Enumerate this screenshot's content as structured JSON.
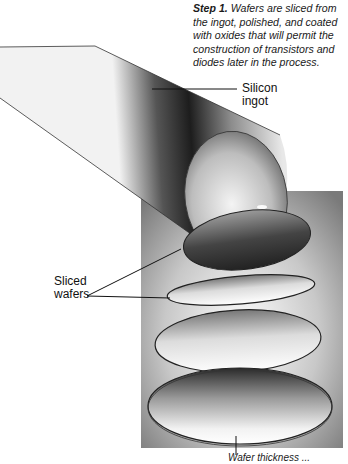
{
  "caption": {
    "step": "Step 1.",
    "text": "Wafers are sliced from the ingot, polished, and coated with oxides that will permit the construction of transistors and diodes later in the process."
  },
  "labels": {
    "ingot_line1": "Silicon",
    "ingot_line2": "ingot",
    "wafers_line1": "Sliced",
    "wafers_line2": "wafers",
    "bottom_clipped": "Wafer thickness ..."
  },
  "colors": {
    "background_panel": "#8a8a8a",
    "ingot_dark": "#1e1e1e",
    "ingot_light": "#e6e6e6",
    "leader_line": "#111111"
  }
}
